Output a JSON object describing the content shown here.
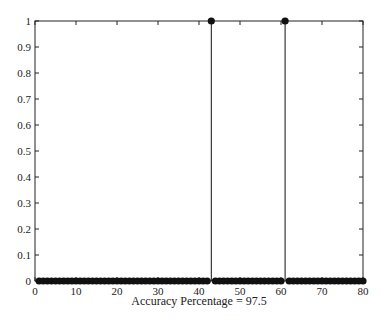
{
  "chart_data": {
    "type": "stem",
    "title": "",
    "xlabel": "Accuracy Percentage = 97.5",
    "ylabel": "",
    "xlim": [
      0,
      80
    ],
    "ylim": [
      0,
      1
    ],
    "x_ticks": [
      0,
      10,
      20,
      30,
      40,
      50,
      60,
      70,
      80
    ],
    "y_ticks": [
      0,
      0.1,
      0.2,
      0.3,
      0.4,
      0.5,
      0.6,
      0.7,
      0.8,
      0.9,
      1
    ],
    "grid": false,
    "n_points": 80,
    "series": [
      {
        "name": "prediction",
        "description": "stem plot over samples 1..80; all values 0 except two at 1",
        "ones_at": [
          43,
          61
        ],
        "values": [
          0,
          0,
          0,
          0,
          0,
          0,
          0,
          0,
          0,
          0,
          0,
          0,
          0,
          0,
          0,
          0,
          0,
          0,
          0,
          0,
          0,
          0,
          0,
          0,
          0,
          0,
          0,
          0,
          0,
          0,
          0,
          0,
          0,
          0,
          0,
          0,
          0,
          0,
          0,
          0,
          0,
          0,
          1,
          0,
          0,
          0,
          0,
          0,
          0,
          0,
          0,
          0,
          0,
          0,
          0,
          0,
          0,
          0,
          0,
          0,
          1,
          0,
          0,
          0,
          0,
          0,
          0,
          0,
          0,
          0,
          0,
          0,
          0,
          0,
          0,
          0,
          0,
          0,
          0,
          0
        ]
      }
    ],
    "colors": {
      "stem": "#111111",
      "axes": "#222222"
    }
  }
}
